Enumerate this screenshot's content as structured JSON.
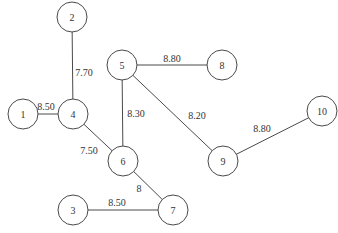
{
  "diagram": {
    "type": "weighted-graph",
    "node_radius": 15,
    "nodes": [
      {
        "id": "1",
        "label": "1",
        "x": 23,
        "y": 114
      },
      {
        "id": "2",
        "label": "2",
        "x": 72,
        "y": 17
      },
      {
        "id": "3",
        "label": "3",
        "x": 73,
        "y": 210
      },
      {
        "id": "4",
        "label": "4",
        "x": 73,
        "y": 114
      },
      {
        "id": "5",
        "label": "5",
        "x": 122,
        "y": 65
      },
      {
        "id": "6",
        "label": "6",
        "x": 123,
        "y": 161
      },
      {
        "id": "7",
        "label": "7",
        "x": 173,
        "y": 210
      },
      {
        "id": "8",
        "label": "8",
        "x": 222,
        "y": 65
      },
      {
        "id": "9",
        "label": "9",
        "x": 223,
        "y": 161
      },
      {
        "id": "10",
        "label": "10",
        "x": 322,
        "y": 111
      }
    ],
    "edges": [
      {
        "from": "1",
        "to": "4",
        "weight": "8.50",
        "lx": 46,
        "ly": 106
      },
      {
        "from": "2",
        "to": "4",
        "weight": "7.70",
        "lx": 84,
        "ly": 72
      },
      {
        "from": "4",
        "to": "6",
        "weight": "7.50",
        "lx": 89,
        "ly": 150
      },
      {
        "from": "5",
        "to": "6",
        "weight": "8.30",
        "lx": 136,
        "ly": 113
      },
      {
        "from": "5",
        "to": "8",
        "weight": "8.80",
        "lx": 172,
        "ly": 58
      },
      {
        "from": "5",
        "to": "9",
        "weight": "8.20",
        "lx": 197,
        "ly": 115
      },
      {
        "from": "6",
        "to": "7",
        "weight": "8",
        "lx": 139,
        "ly": 188
      },
      {
        "from": "3",
        "to": "7",
        "weight": "8.50",
        "lx": 117,
        "ly": 202
      },
      {
        "from": "9",
        "to": "10",
        "weight": "8.80",
        "lx": 262,
        "ly": 128
      }
    ]
  }
}
